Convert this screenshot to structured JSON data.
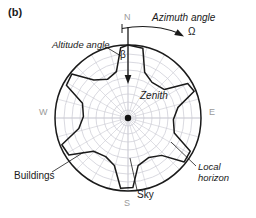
{
  "figure": {
    "panel_label": "(b)",
    "caption_labels": {
      "azimuth_angle": "Azimuth angle",
      "omega_symbol": "Ω",
      "altitude_angle": "Altitude angle",
      "beta_symbol": "β",
      "zenith": "Zenith",
      "buildings": "Buildings",
      "local_horizon_line1": "Local",
      "local_horizon_line2": "horizon",
      "sky": "Sky"
    },
    "cardinals": {
      "north": "N",
      "south": "S",
      "east": "E",
      "west": "W"
    },
    "colors": {
      "ink": "#1a1a1a",
      "grid": "#c9c9d2",
      "cardinal_text": "#9a9a9a",
      "horizon_stroke": "#1a1a1a",
      "background": "#ffffff"
    }
  },
  "chart_data": {
    "type": "polar",
    "projection": "equidistant azimuthal (sky dome projected to disc)",
    "center": {
      "x": 128,
      "y": 118,
      "label": "Zenith"
    },
    "outer_radius": 73,
    "grid": {
      "on": true,
      "altitude_rings_count": 9,
      "ring_radii": [
        8,
        16,
        24,
        32,
        40,
        48,
        56,
        64,
        73
      ],
      "altitude_tick_labels_deg": [
        90,
        80,
        70,
        60,
        50,
        40,
        30,
        20,
        10,
        0
      ],
      "azimuth_spokes_count": 24,
      "azimuth_spoke_step_deg": 15
    },
    "axes": {
      "azimuth_label": "Azimuth angle",
      "azimuth_symbol": "Ω",
      "azimuth_direction": "clockwise from North",
      "altitude_label": "Altitude angle",
      "altitude_symbol": "β",
      "altitude_range_deg": [
        0,
        90
      ],
      "azimuth_range_deg": [
        0,
        360
      ]
    },
    "cardinal_ticks": [
      {
        "label": "N",
        "azimuth_deg": 0
      },
      {
        "label": "E",
        "azimuth_deg": 90
      },
      {
        "label": "S",
        "azimuth_deg": 180
      },
      {
        "label": "W",
        "azimuth_deg": 270
      }
    ],
    "legend": [
      {
        "name": "Sky",
        "description": "open region inside the local horizon"
      },
      {
        "name": "Buildings",
        "description": "shaded obstruction region outside the local horizon"
      },
      {
        "name": "Local horizon",
        "description": "jagged boundary curve of obstruction altitude vs azimuth"
      }
    ],
    "local_horizon_profile": {
      "description": "Obstruction (building) altitude angle as a function of azimuth; radius in the disc = 73 * (1 - beta/90).",
      "units": {
        "azimuth": "deg",
        "altitude": "deg"
      },
      "points": [
        {
          "azimuth_deg": 0,
          "altitude_deg": 0
        },
        {
          "azimuth_deg": 12,
          "altitude_deg": 2
        },
        {
          "azimuth_deg": 20,
          "altitude_deg": 30
        },
        {
          "azimuth_deg": 34,
          "altitude_deg": 37
        },
        {
          "azimuth_deg": 52,
          "altitude_deg": 33
        },
        {
          "azimuth_deg": 60,
          "altitude_deg": 5
        },
        {
          "azimuth_deg": 68,
          "altitude_deg": 2
        },
        {
          "azimuth_deg": 78,
          "altitude_deg": 27
        },
        {
          "azimuth_deg": 92,
          "altitude_deg": 34
        },
        {
          "azimuth_deg": 108,
          "altitude_deg": 30
        },
        {
          "azimuth_deg": 118,
          "altitude_deg": 3
        },
        {
          "azimuth_deg": 128,
          "altitude_deg": 2
        },
        {
          "azimuth_deg": 138,
          "altitude_deg": 28
        },
        {
          "azimuth_deg": 152,
          "altitude_deg": 35
        },
        {
          "azimuth_deg": 168,
          "altitude_deg": 30
        },
        {
          "azimuth_deg": 176,
          "altitude_deg": 4
        },
        {
          "azimuth_deg": 186,
          "altitude_deg": 3
        },
        {
          "azimuth_deg": 196,
          "altitude_deg": 29
        },
        {
          "azimuth_deg": 210,
          "altitude_deg": 35
        },
        {
          "azimuth_deg": 226,
          "altitude_deg": 31
        },
        {
          "azimuth_deg": 238,
          "altitude_deg": 4
        },
        {
          "azimuth_deg": 248,
          "altitude_deg": 2
        },
        {
          "azimuth_deg": 258,
          "altitude_deg": 28
        },
        {
          "azimuth_deg": 272,
          "altitude_deg": 35
        },
        {
          "azimuth_deg": 288,
          "altitude_deg": 31
        },
        {
          "azimuth_deg": 298,
          "altitude_deg": 4
        },
        {
          "azimuth_deg": 308,
          "altitude_deg": 2
        },
        {
          "azimuth_deg": 318,
          "altitude_deg": 27
        },
        {
          "azimuth_deg": 332,
          "altitude_deg": 36
        },
        {
          "azimuth_deg": 346,
          "altitude_deg": 31
        },
        {
          "azimuth_deg": 354,
          "altitude_deg": 3
        }
      ]
    },
    "annotations": [
      {
        "text": "Azimuth angle",
        "symbol": "Ω",
        "type": "curved-arrow",
        "at": "top-right outside disc",
        "direction": "clockwise"
      },
      {
        "text": "Altitude angle",
        "symbol": "β",
        "type": "straight-arrow",
        "at": "north radius",
        "direction": "inward toward zenith"
      },
      {
        "text": "Zenith",
        "type": "point-label",
        "at": "center"
      },
      {
        "text": "Buildings",
        "type": "leader-line",
        "at": "lower-left"
      },
      {
        "text": "Local horizon",
        "type": "leader-line",
        "at": "lower-right"
      },
      {
        "text": "Sky",
        "type": "leader-line",
        "at": "bottom"
      }
    ]
  }
}
